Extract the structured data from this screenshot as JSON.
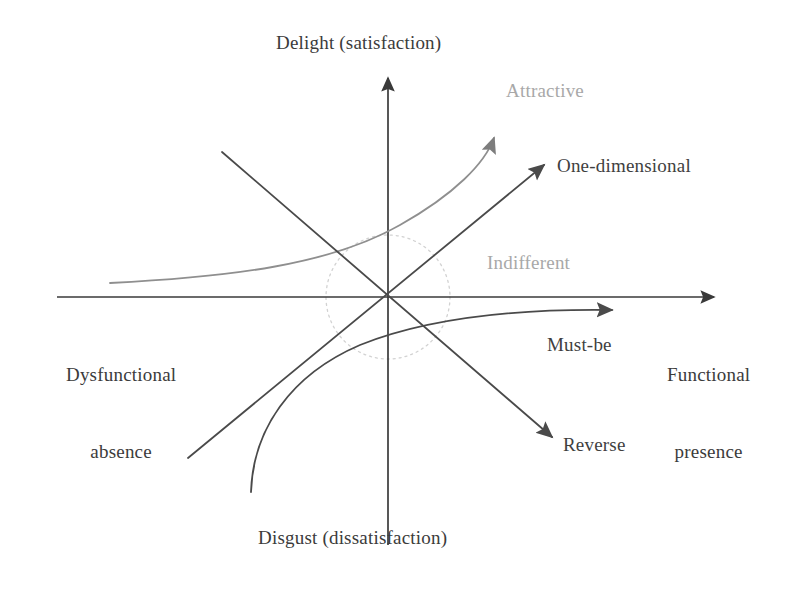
{
  "diagram": {
    "axes": {
      "y_top_label": "Delight (satisfaction)",
      "y_bottom_label": "Disgust (dissatisfaction)",
      "x_left_label_line1": "Dysfunctional",
      "x_left_label_line2": "absence",
      "x_right_label_line1": "Functional",
      "x_right_label_line2": "presence"
    },
    "categories": {
      "attractive": "Attractive",
      "one_dimensional": "One-dimensional",
      "indifferent": "Indifferent",
      "must_be": "Must-be",
      "reverse": "Reverse"
    },
    "colors": {
      "axis": "#3a3a3a",
      "curve_dark": "#4a4a4a",
      "curve_light": "#8f8f8f",
      "label_dark": "#3f3f3f",
      "label_light": "#a8a8a8",
      "circle_dotted": "#cfcfcf",
      "background": "#ffffff"
    },
    "geometry": {
      "origin_x": 388,
      "origin_y": 297,
      "circle_radius": 62
    }
  }
}
